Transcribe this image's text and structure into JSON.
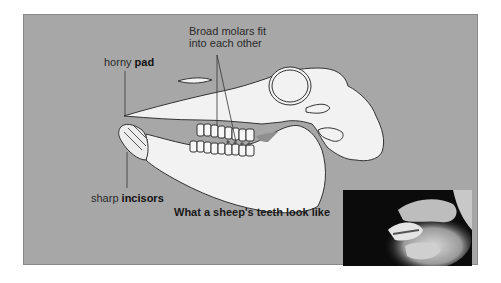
{
  "diagram": {
    "labels": {
      "molars_line1": "Broad molars fit",
      "molars_line2": "into each other",
      "pad_prefix": "horny ",
      "pad_bold": "pad",
      "incisors_prefix": "sharp ",
      "incisors_bold": "incisors"
    },
    "caption": "What a sheep's teeth look like",
    "colors": {
      "panel_bg": "#a7a7a7",
      "skull_fill": "#f2f2f2",
      "outline": "#333333",
      "shadow_gap": "#8f8f8f"
    },
    "photo": {
      "description": "Photo of hands holding open a sheep's mouth showing its teeth"
    }
  }
}
